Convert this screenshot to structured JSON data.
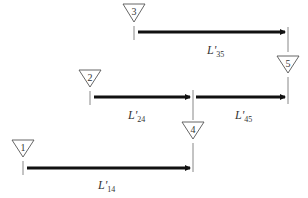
{
  "diagram": {
    "nodes": [
      {
        "id": "1",
        "label": "1"
      },
      {
        "id": "2",
        "label": "2"
      },
      {
        "id": "3",
        "label": "3"
      },
      {
        "id": "4",
        "label": "4"
      },
      {
        "id": "5",
        "label": "5"
      }
    ],
    "edges": [
      {
        "from": "3",
        "to": "5",
        "label_main": "L'",
        "label_sub": "35"
      },
      {
        "from": "2",
        "to": "4",
        "label_main": "L'",
        "label_sub": "24"
      },
      {
        "from": "4",
        "to": "5",
        "label_main": "L'",
        "label_sub": "45"
      },
      {
        "from": "1",
        "to": "4",
        "label_main": "L'",
        "label_sub": "14"
      }
    ],
    "colors": {
      "arrow": "#111111",
      "tick": "#888888",
      "triangle_stroke": "#555555"
    }
  }
}
